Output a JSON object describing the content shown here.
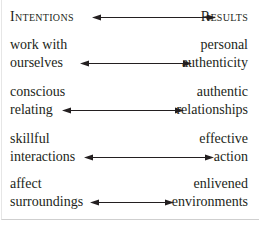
{
  "header": {
    "left": "Intentions",
    "right": "Results"
  },
  "pairs": [
    {
      "left_line1": "work with",
      "left_line2": "ourselves",
      "right_line1": "personal",
      "right_line2": "authenticity"
    },
    {
      "left_line1": "conscious",
      "left_line2": "relating",
      "right_line1": "authentic",
      "right_line2": "relationships"
    },
    {
      "left_line1": "skillful",
      "left_line2": "interactions",
      "right_line1": "effective",
      "right_line2": "action"
    },
    {
      "left_line1": "affect",
      "left_line2": "surroundings",
      "right_line1": "enlivened",
      "right_line2": "environments"
    }
  ],
  "icons": {
    "connector": "double-headed-arrow"
  }
}
